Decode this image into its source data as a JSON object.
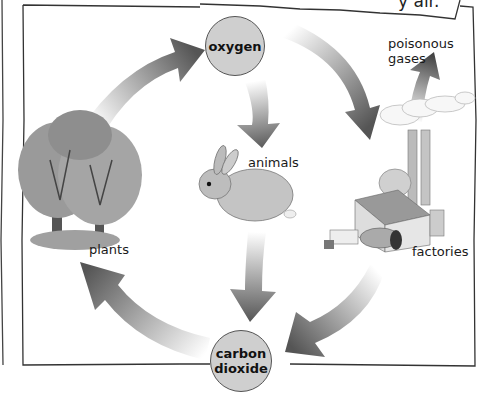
{
  "diagram": {
    "type": "cycle",
    "speech_bubble_fragment": "y air.",
    "nodes": {
      "oxygen": {
        "label": "oxygen"
      },
      "carbon_dioxide": {
        "line1": "carbon",
        "line2": "dioxide"
      }
    },
    "labels": {
      "plants": "plants",
      "animals": "animals",
      "factories": "factories",
      "poisonous_gases_line1": "poisonous",
      "poisonous_gases_line2": "gases"
    },
    "edges": [
      {
        "from": "plants",
        "to": "oxygen"
      },
      {
        "from": "oxygen",
        "to": "animals"
      },
      {
        "from": "oxygen",
        "to": "factories"
      },
      {
        "from": "factories",
        "to": "poisonous gases"
      },
      {
        "from": "animals",
        "to": "carbon dioxide"
      },
      {
        "from": "factories",
        "to": "carbon dioxide"
      },
      {
        "from": "carbon dioxide",
        "to": "plants"
      }
    ],
    "colors": {
      "node_fill": "#cfcfcf",
      "arrow_dark": "#555555",
      "frame": "#333333"
    }
  }
}
